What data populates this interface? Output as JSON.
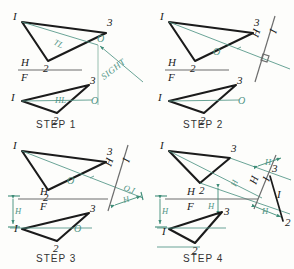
{
  "figure": {
    "colors": {
      "object_line": "#1b1b1b",
      "construction_line": "#4f9384",
      "reference_line": "#6d6d6d",
      "dimension": "#3f8d78",
      "background": "#fdfdfb"
    }
  },
  "steps": [
    {
      "id": "step1",
      "caption": "STEP  1",
      "top_view": {
        "vertices": [
          {
            "name": "1",
            "label": "I"
          },
          {
            "name": "2",
            "label": "2"
          },
          {
            "name": "3",
            "label": "3"
          }
        ],
        "point_o": "O",
        "true_length_label": "TL"
      },
      "front_view": {
        "vertices": [
          {
            "name": "1",
            "label": "I"
          },
          {
            "name": "2",
            "label": "2"
          },
          {
            "name": "3",
            "label": "3"
          }
        ],
        "point_o": "O",
        "horizontal_line_label": "HL"
      },
      "reference_line": {
        "upper": "H",
        "lower": "F"
      },
      "sight_label": "SIGHT"
    },
    {
      "id": "step2",
      "caption": "STEP  2",
      "top_view": {
        "vertices": [
          {
            "name": "1",
            "label": "I"
          },
          {
            "name": "2",
            "label": "2"
          },
          {
            "name": "3",
            "label": "3"
          }
        ],
        "point_o": "O"
      },
      "front_view": {
        "vertices": [
          {
            "name": "1",
            "label": "I"
          },
          {
            "name": "2",
            "label": "2"
          },
          {
            "name": "3",
            "label": "3"
          }
        ],
        "point_o": "O"
      },
      "reference_line": {
        "upper": "H",
        "lower": "F"
      },
      "new_reference_line": {
        "upper": "H",
        "lower": "I"
      },
      "perpendicular_mark": true
    },
    {
      "id": "step3",
      "caption": "STEP  3",
      "top_view": {
        "vertices": [
          {
            "name": "1",
            "label": "I"
          },
          {
            "name": "2",
            "label": "2"
          },
          {
            "name": "3",
            "label": "3"
          }
        ],
        "point_o": "O"
      },
      "front_view": {
        "vertices": [
          {
            "name": "1",
            "label": "I"
          },
          {
            "name": "2",
            "label": "2"
          },
          {
            "name": "3",
            "label": "3"
          }
        ],
        "point_o": "O"
      },
      "reference_line": {
        "upper": "H",
        "lower": "F"
      },
      "new_reference_line": {
        "upper": "H",
        "lower": "I"
      },
      "projected_point_label": "O,I",
      "dimensions": [
        {
          "name": "front-view-height",
          "label": "H"
        },
        {
          "name": "auxiliary-height",
          "label": "H"
        }
      ]
    },
    {
      "id": "step4",
      "caption": "STEP  4",
      "top_view": {
        "vertices": [
          {
            "name": "1",
            "label": "I"
          },
          {
            "name": "2",
            "label": "2"
          },
          {
            "name": "3",
            "label": "3"
          }
        ]
      },
      "front_view": {
        "vertices": [
          {
            "name": "1",
            "label": "I"
          },
          {
            "name": "2",
            "label": "2"
          },
          {
            "name": "3",
            "label": "3"
          }
        ]
      },
      "edge_view": {
        "vertices": [
          {
            "name": "3",
            "label": "3"
          },
          {
            "name": "1",
            "label": "I"
          },
          {
            "name": "2",
            "label": "2"
          }
        ]
      },
      "reference_line": {
        "upper": "H",
        "lower": "F"
      },
      "new_reference_line": {
        "upper": "H",
        "lower": "I"
      },
      "dimensions": [
        {
          "name": "front-height-1",
          "label": "H"
        },
        {
          "name": "front-height-2",
          "label": "H"
        },
        {
          "name": "aux-height-3",
          "label": "H"
        },
        {
          "name": "aux-height-2",
          "label": "H"
        },
        {
          "name": "aux-height-mid",
          "label": "H"
        }
      ]
    }
  ]
}
